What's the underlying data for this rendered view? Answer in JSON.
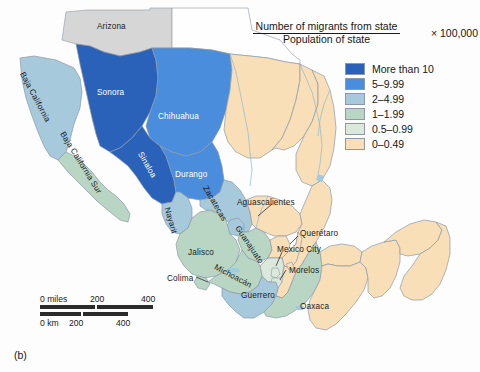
{
  "figure": {
    "label": "(b)",
    "title_numerator": "Number of migrants from state",
    "title_denominator": "Population of state",
    "title_multiplier": "× 100,000"
  },
  "legend": {
    "items": [
      {
        "label": "More than 10",
        "color": "#2a62ba"
      },
      {
        "label": "5–9.99",
        "color": "#4a8ddc"
      },
      {
        "label": "2–4.99",
        "color": "#a6c9dc"
      },
      {
        "label": "1–1.99",
        "color": "#b9d6c4"
      },
      {
        "label": "0.5–0.99",
        "color": "#dbe9dc"
      },
      {
        "label": "0–0.49",
        "color": "#f8dfb8"
      }
    ]
  },
  "scale": {
    "miles": {
      "zero": "0 miles",
      "mid": "200",
      "end": "400"
    },
    "km": {
      "zero": "0 km",
      "mid": "200",
      "end": "400"
    }
  },
  "map": {
    "neighbor_label": "Arizona",
    "state_labels": [
      {
        "name": "Baja California",
        "text": "Baja California",
        "x": 22,
        "y": 68,
        "rotate": 62,
        "light": false
      },
      {
        "name": "Baja California Sur",
        "text": "Baja California Sur",
        "x": 62,
        "y": 128,
        "rotate": 58,
        "light": false
      },
      {
        "name": "Sonora",
        "text": "Sonora",
        "x": 97,
        "y": 88,
        "rotate": 0,
        "light": true
      },
      {
        "name": "Chihuahua",
        "text": "Chihuahua",
        "x": 158,
        "y": 112,
        "rotate": 0,
        "light": true
      },
      {
        "name": "Sinaloa",
        "text": "Sinaloa",
        "x": 140,
        "y": 148,
        "rotate": 60,
        "light": true
      },
      {
        "name": "Durango",
        "text": "Durango",
        "x": 175,
        "y": 170,
        "rotate": 0,
        "light": true
      },
      {
        "name": "Zacatecas",
        "text": "Zacatecas",
        "x": 205,
        "y": 182,
        "rotate": 60,
        "light": false
      },
      {
        "name": "Nayarit",
        "text": "Nayarit",
        "x": 167,
        "y": 203,
        "rotate": 74,
        "light": false
      },
      {
        "name": "Aguascalientes",
        "text": "Aguascalientes",
        "x": 237,
        "y": 198,
        "rotate": 0,
        "light": false
      },
      {
        "name": "Jalisco",
        "text": "Jalisco",
        "x": 188,
        "y": 248,
        "rotate": 0,
        "light": false
      },
      {
        "name": "Guanajuato",
        "text": "Guanajuato",
        "x": 237,
        "y": 222,
        "rotate": 56,
        "light": false
      },
      {
        "name": "Querétaro",
        "text": "Querétaro",
        "x": 300,
        "y": 229,
        "rotate": 0,
        "light": false
      },
      {
        "name": "Mexico City",
        "text": "Mexico City",
        "x": 277,
        "y": 245,
        "rotate": 0,
        "light": false
      },
      {
        "name": "Morelos",
        "text": "Morelos",
        "x": 289,
        "y": 266,
        "rotate": 0,
        "light": false
      },
      {
        "name": "Michoacán",
        "text": "Michoacán",
        "x": 215,
        "y": 262,
        "rotate": 28,
        "light": false
      },
      {
        "name": "Colima",
        "text": "Colima",
        "x": 167,
        "y": 274,
        "rotate": 0,
        "light": false
      },
      {
        "name": "Guerrero",
        "text": "Guerrero",
        "x": 241,
        "y": 291,
        "rotate": 0,
        "light": false
      },
      {
        "name": "Oaxaca",
        "text": "Oaxaca",
        "x": 300,
        "y": 302,
        "rotate": 0,
        "light": false
      }
    ]
  },
  "colors": {
    "class1": "#2a62ba",
    "class2": "#4a8ddc",
    "class3": "#a6c9dc",
    "class4": "#b9d6c4",
    "class5": "#dbe9dc",
    "class6": "#f8dfb8",
    "neighbor_gray": "#d6d6d6",
    "border": "#8d9aa6",
    "water": "#bcd8e8",
    "background": "#fdfdfd"
  }
}
